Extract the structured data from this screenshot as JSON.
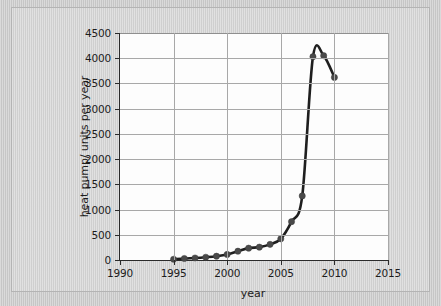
{
  "figure": {
    "background_color": "#d2d2d2",
    "plot_background_color": "#fdfdfd",
    "axis_color": "#2b2b2b",
    "grid_color": "#a8a8a8",
    "line_color": "#1f1f1f",
    "marker_color": "#4a4a4a"
  },
  "chart_data": {
    "type": "line",
    "title": "",
    "xlabel": "year",
    "ylabel": "heat pump/ units per year",
    "xlim": [
      1990,
      2015
    ],
    "ylim": [
      0,
      4500
    ],
    "xticks": [
      1990,
      1995,
      2000,
      2005,
      2010,
      2015
    ],
    "xtick_labels": [
      "1990",
      "1995",
      "2000",
      "2005",
      "2010",
      "2015"
    ],
    "yticks": [
      0,
      500,
      1000,
      1500,
      2000,
      2500,
      3000,
      3500,
      4000,
      4500
    ],
    "ytick_labels": [
      "0",
      "500",
      "1000",
      "1500",
      "2000",
      "2500",
      "3000",
      "3500",
      "4000",
      "4500"
    ],
    "grid": true,
    "legend": "none",
    "markers": "filled-circle",
    "series": [
      {
        "name": "heat pump installations",
        "x": [
          1995,
          1996,
          1997,
          1998,
          1999,
          2000,
          2001,
          2002,
          2003,
          2004,
          2005,
          2006,
          2007,
          2008,
          2009,
          2010
        ],
        "values": [
          15,
          30,
          40,
          55,
          75,
          110,
          175,
          235,
          255,
          310,
          420,
          760,
          1270,
          4030,
          4050,
          3620
        ]
      }
    ]
  }
}
